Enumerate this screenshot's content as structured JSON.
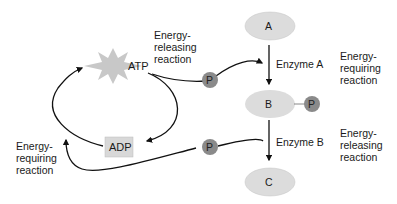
{
  "diagram": {
    "molecules": {
      "a": {
        "label": "A"
      },
      "b": {
        "label": "B"
      },
      "c": {
        "label": "C"
      }
    },
    "enzymes": {
      "a": "Enzyme A",
      "b": "Enzyme B"
    },
    "cofactors": {
      "atp": "ATP",
      "adp": "ADP",
      "phosphate": "P"
    },
    "annotations": {
      "atp_release": [
        "Energy-",
        "releasing",
        "reaction"
      ],
      "a_to_b": [
        "Energy-",
        "requiring",
        "reaction"
      ],
      "b_to_c": [
        "Energy-",
        "releasing",
        "reaction"
      ],
      "adp_regen": [
        "Energy-",
        "requiring",
        "reaction"
      ]
    },
    "colors": {
      "molecule_fill": "#dcdcdc",
      "phosphate_fill": "#8a8a8a",
      "atp_star": "#c8c8c8",
      "adp_box": "#d8d8d8",
      "arrow": "#111111"
    }
  }
}
